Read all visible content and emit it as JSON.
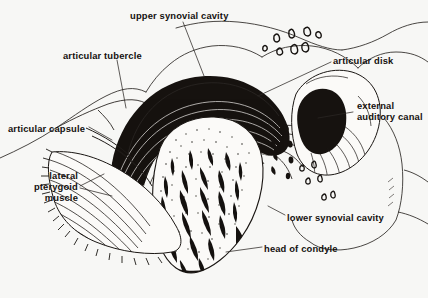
{
  "figure": {
    "background_color": "#f7f7f5",
    "ink_color": "#14110f",
    "labels": [
      {
        "id": "upper-synovial-cavity",
        "text": "upper synovial cavity",
        "x": 130,
        "y": 10,
        "align": "left"
      },
      {
        "id": "articular-tubercle",
        "text": "articular tubercle",
        "x": 63,
        "y": 50,
        "align": "left"
      },
      {
        "id": "articular-disk",
        "text": "articular disk",
        "x": 333,
        "y": 55,
        "align": "left"
      },
      {
        "id": "articular-capsule",
        "text": "articular capsule",
        "x": 8,
        "y": 123,
        "align": "left"
      },
      {
        "id": "external-auditory-canal",
        "text": "external\nauditory canal",
        "x": 357,
        "y": 100,
        "align": "left"
      },
      {
        "id": "lateral-pterygoid-muscle",
        "text": "lateral\npterygoid\nmuscle",
        "x": 22,
        "y": 170,
        "align": "right",
        "width": 56
      },
      {
        "id": "lower-synovial-cavity",
        "text": "lower synovial cavity",
        "x": 287,
        "y": 212,
        "align": "left"
      },
      {
        "id": "head-of-condyle",
        "text": "head of condyle",
        "x": 264,
        "y": 243,
        "align": "left"
      }
    ],
    "structures": [
      {
        "id": "temporal-bone",
        "name": "temporal bone"
      },
      {
        "id": "articular-tubercle-shape",
        "name": "articular tubercle"
      },
      {
        "id": "articular-disk-shape",
        "name": "articular disk"
      },
      {
        "id": "upper-synovial-cavity-shape",
        "name": "upper synovial cavity"
      },
      {
        "id": "lower-synovial-cavity-shape",
        "name": "lower synovial cavity"
      },
      {
        "id": "condyle-head-shape",
        "name": "head of condyle"
      },
      {
        "id": "trabecular-bone",
        "name": "trabecular bone"
      },
      {
        "id": "lateral-pterygoid-shape",
        "name": "lateral pterygoid muscle"
      },
      {
        "id": "articular-capsule-shape",
        "name": "articular capsule"
      },
      {
        "id": "external-auditory-canal-shape",
        "name": "external auditory canal"
      },
      {
        "id": "cancellous-marks",
        "name": "cancellous bone marks"
      }
    ]
  }
}
